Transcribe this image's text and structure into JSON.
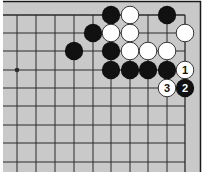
{
  "diagram": {
    "type": "go-board-fragment",
    "corner": "top-right",
    "colors": {
      "board": "#c9c9c9",
      "line": "#2a2a2a",
      "black_stone": "#111111",
      "white_stone": "#ffffff",
      "white_outline": "#222222",
      "border": "#1a1a1a"
    },
    "grid": {
      "columns_x": [
        17,
        36,
        55,
        74,
        93,
        111,
        130,
        148,
        167,
        185
      ],
      "rows_y": [
        15,
        33,
        51,
        70,
        88,
        106,
        125,
        143,
        162
      ],
      "right_edge_col": 9,
      "top_edge_row": 0
    },
    "star_points": [
      {
        "col": 0,
        "row": 3
      }
    ],
    "stones": [
      {
        "col": 5,
        "row": 0,
        "color": "black",
        "label": ""
      },
      {
        "col": 6,
        "row": 0,
        "color": "white",
        "label": ""
      },
      {
        "col": 8,
        "row": 0,
        "color": "black",
        "label": ""
      },
      {
        "col": 4,
        "row": 1,
        "color": "black",
        "label": ""
      },
      {
        "col": 5,
        "row": 1,
        "color": "white",
        "label": ""
      },
      {
        "col": 6,
        "row": 1,
        "color": "white",
        "label": ""
      },
      {
        "col": 9,
        "row": 1,
        "color": "white",
        "label": ""
      },
      {
        "col": 3,
        "row": 2,
        "color": "black",
        "label": ""
      },
      {
        "col": 5,
        "row": 2,
        "color": "black",
        "label": ""
      },
      {
        "col": 6,
        "row": 2,
        "color": "white",
        "label": ""
      },
      {
        "col": 7,
        "row": 2,
        "color": "white",
        "label": ""
      },
      {
        "col": 8,
        "row": 2,
        "color": "white",
        "label": ""
      },
      {
        "col": 5,
        "row": 3,
        "color": "black",
        "label": ""
      },
      {
        "col": 6,
        "row": 3,
        "color": "black",
        "label": ""
      },
      {
        "col": 7,
        "row": 3,
        "color": "black",
        "label": ""
      },
      {
        "col": 8,
        "row": 3,
        "color": "black",
        "label": ""
      },
      {
        "col": 9,
        "row": 3,
        "color": "white",
        "label": "1"
      },
      {
        "col": 9,
        "row": 4,
        "color": "black",
        "label": "2"
      },
      {
        "col": 8,
        "row": 4,
        "color": "white",
        "label": "3"
      }
    ]
  }
}
